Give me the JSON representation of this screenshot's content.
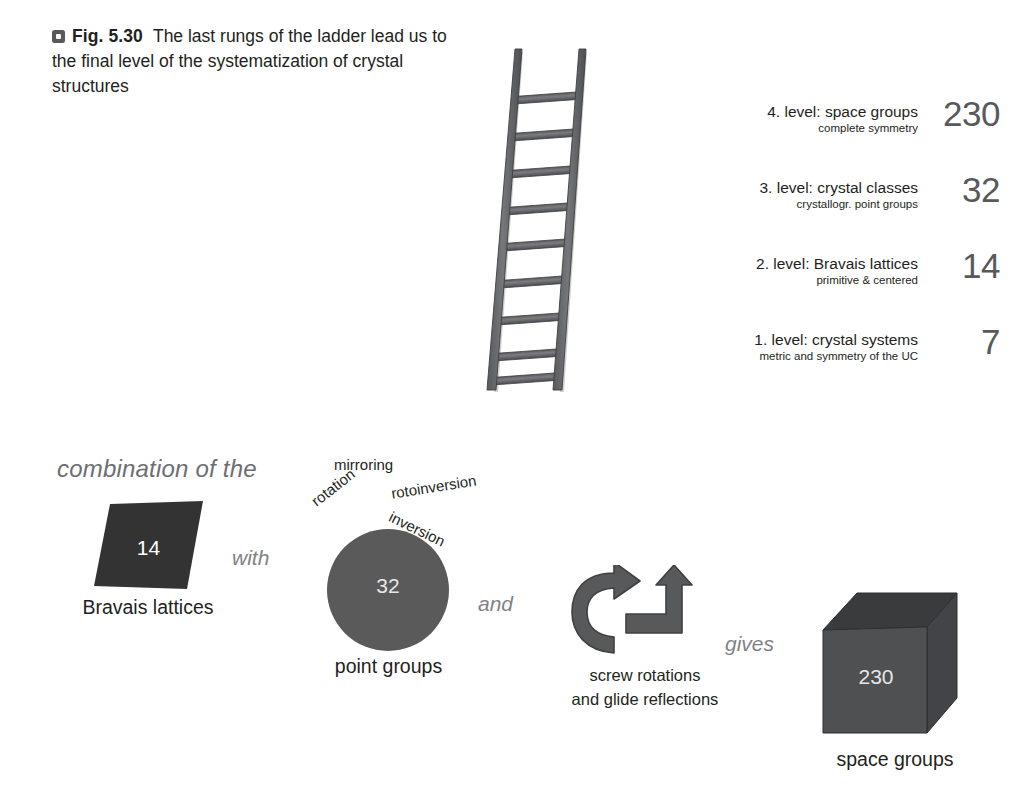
{
  "figure": {
    "marker_icon": "square-marker-icon",
    "number_label": "Fig. 5.30",
    "caption": "The last rungs of the ladder lead us to the final level of the systematization of crystal structures"
  },
  "ladder": {
    "icon": "ladder-icon",
    "rung_count": 9,
    "rail_color": "#6b6c6e"
  },
  "levels": [
    {
      "title": "4. level: space groups",
      "subtitle": "complete symmetry",
      "count": "230"
    },
    {
      "title": "3. level: crystal classes",
      "subtitle": "crystallogr. point groups",
      "count": "32"
    },
    {
      "title": "2. level: Bravais lattices",
      "subtitle": "primitive & centered",
      "count": "14"
    },
    {
      "title": "1. level: crystal systems",
      "subtitle": "metric and symmetry of the UC",
      "count": "7"
    }
  ],
  "flow": {
    "intro": "combination of the",
    "connector_with": "with",
    "connector_and": "and",
    "connector_gives": "gives",
    "bravais": {
      "shape_icon": "parallelogram-icon",
      "value": "14",
      "label": "Bravais lattices",
      "fill": "#333333"
    },
    "point_groups": {
      "shape_icon": "circle-icon",
      "value": "32",
      "label": "point groups",
      "fill": "#5a5a5a",
      "symmetry_operations": [
        "mirroring",
        "rotation",
        "rotoinversion",
        "inversion"
      ]
    },
    "operations": {
      "curved_arrow_icon": "curved-rotation-arrow-icon",
      "glide_arrow_icon": "glide-reflection-arrow-icon",
      "label_line1": "screw rotations",
      "label_line2": "and glide reflections",
      "fill": "#58595b"
    },
    "space_groups": {
      "shape_icon": "cube-icon",
      "value": "230",
      "label": "space groups",
      "front_fill": "#4f5052",
      "top_fill": "#3a3b3d",
      "side_fill": "#45464a"
    }
  },
  "colors": {
    "text": "#231f20",
    "muted": "#808285",
    "count": "#58595b"
  }
}
